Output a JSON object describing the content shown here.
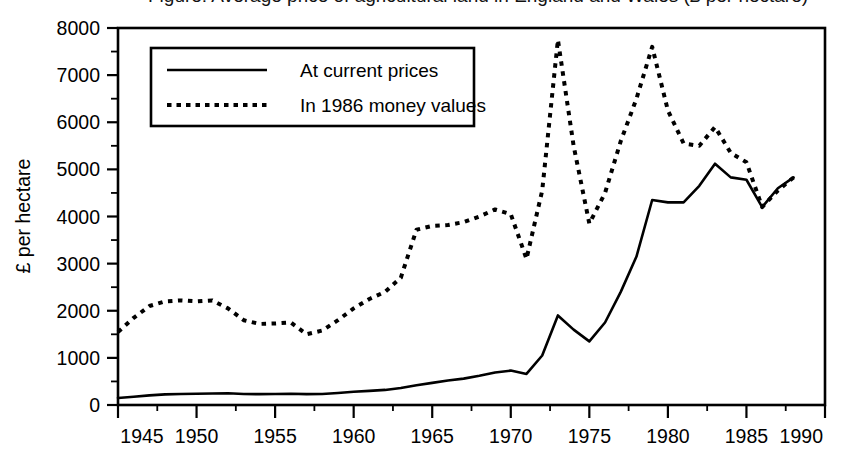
{
  "figure": {
    "title_clipped": "Figure: Average price of agricultural land in England and Wales (£ per hectare)",
    "background_color": "#ffffff",
    "line_color": "#000000"
  },
  "chart_data": {
    "type": "line",
    "title": "",
    "xlabel": "",
    "ylabel": "£ per hectare",
    "xlim": [
      1945,
      1990
    ],
    "ylim": [
      0,
      8000
    ],
    "grid": false,
    "legend_position": "upper-left-inside",
    "x_ticks": [
      "1945",
      "1950",
      "1955",
      "1960",
      "1965",
      "1970",
      "1975",
      "1980",
      "1985",
      "1990"
    ],
    "x_tick_values": [
      1945,
      1950,
      1955,
      1960,
      1965,
      1970,
      1975,
      1980,
      1985,
      1990
    ],
    "x_minor_tick_interval": 2.5,
    "y_ticks": [
      "0",
      "1000",
      "2000",
      "3000",
      "4000",
      "5000",
      "6000",
      "7000",
      "8000"
    ],
    "y_tick_values": [
      0,
      1000,
      2000,
      3000,
      4000,
      5000,
      6000,
      7000,
      8000
    ],
    "y_minor_tick_interval": 500,
    "x": [
      1945,
      1946,
      1947,
      1948,
      1949,
      1950,
      1951,
      1952,
      1953,
      1954,
      1955,
      1956,
      1957,
      1958,
      1959,
      1960,
      1961,
      1962,
      1963,
      1964,
      1965,
      1966,
      1967,
      1968,
      1969,
      1970,
      1971,
      1972,
      1973,
      1974,
      1975,
      1976,
      1977,
      1978,
      1979,
      1980,
      1981,
      1982,
      1983,
      1984,
      1985,
      1986,
      1987,
      1988
    ],
    "series": [
      {
        "name": "At current prices",
        "style": "solid",
        "values": [
          150,
          175,
          205,
          225,
          235,
          240,
          245,
          250,
          235,
          230,
          235,
          240,
          230,
          235,
          255,
          280,
          300,
          320,
          360,
          420,
          470,
          520,
          560,
          620,
          690,
          730,
          660,
          1050,
          1900,
          1600,
          1350,
          1750,
          2400,
          3150,
          4350,
          4300,
          4300,
          4650,
          5120,
          4830,
          4780,
          4200,
          4600,
          4830
        ]
      },
      {
        "name": "In 1986 money values",
        "style": "dotted",
        "values": [
          1550,
          1850,
          2100,
          2200,
          2220,
          2200,
          2220,
          2050,
          1800,
          1720,
          1730,
          1750,
          1500,
          1580,
          1800,
          2050,
          2250,
          2400,
          2700,
          3720,
          3800,
          3820,
          3880,
          4000,
          4150,
          4050,
          3100,
          4550,
          7750,
          5500,
          3850,
          4500,
          5600,
          6500,
          7600,
          6250,
          5550,
          5500,
          5900,
          5350,
          5150,
          4200,
          4550,
          4830
        ]
      }
    ],
    "annotations": {
      "peak_1973_real": 7750,
      "trough_1975_real": 3850,
      "peak_1979_real": 7600,
      "peak_1983_nominal": 5120
    }
  },
  "legend": {
    "items": [
      {
        "label": "At current prices",
        "style": "solid"
      },
      {
        "label": "In 1986 money values",
        "style": "dotted"
      }
    ]
  },
  "axes": {
    "y_title": "£ per hectare"
  }
}
